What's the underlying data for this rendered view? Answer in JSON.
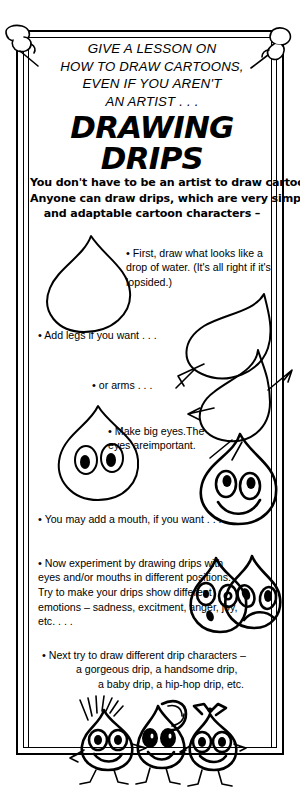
{
  "poster": {
    "kicker": {
      "line1": "GIVE A LESSON ON",
      "line2": "HOW TO DRAW CARTOONS,",
      "line3": "EVEN IF YOU AREN'T",
      "line4": "AN ARTIST . . ."
    },
    "title": "DRAWING DRIPS",
    "lede": {
      "line1": "You don't have to be an artist to draw cartoons.",
      "line2": "Anyone can draw drips, which are very simple",
      "line3": "and adaptable cartoon characters –"
    },
    "steps": [
      {
        "id": "step-1",
        "bullet": "•",
        "text": "First, draw what looks like a drop of water. (It's all right if it's lopsided.)"
      },
      {
        "id": "step-2",
        "bullet": "•",
        "text": "Add legs if you want . . ."
      },
      {
        "id": "step-3",
        "bullet": "•",
        "text": "or arms . . ."
      },
      {
        "id": "step-4",
        "bullet": "•",
        "line1": "Make big eyes.",
        "line2": "The eyes are",
        "line3": "important."
      },
      {
        "id": "step-5",
        "bullet": "•",
        "text": "You may add a mouth, if you want . . ."
      },
      {
        "id": "step-6",
        "bullet": "•",
        "text": "Now experiment by drawing drips with eyes and/or mouths in different positions. Try to make your drips show different emotions – sadness, excitment, anger, joy, etc. . . ."
      },
      {
        "id": "step-7",
        "bullet": "•",
        "line1": "Next try to draw different drip characters –",
        "line2": "a gorgeous drip, a handsome drip,",
        "line3": "a baby drip, a hip-hop drip, etc."
      }
    ],
    "illustrations": {
      "plain_drip": "plain-drip-outline",
      "legged_drip": "drip-with-legs",
      "armed_drip": "drip-with-arms",
      "eyes_drip": "drip-with-big-eyes",
      "smiling_drip": "drip-with-smile",
      "emotion_drips": "surprised-and-sad-drips",
      "character_drips": "hip-hop-gorgeous-and-baby-drips"
    }
  },
  "colors": {
    "ink": "#000000",
    "paper": "#ffffff"
  }
}
